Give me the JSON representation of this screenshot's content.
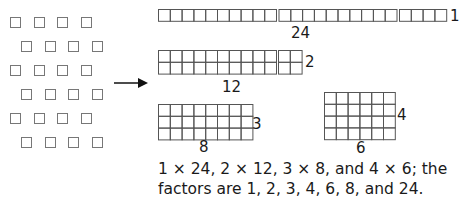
{
  "figure": {
    "ungrouped_squares": {
      "count": 24,
      "rows": 6,
      "per_row": 4
    },
    "arrangements": [
      {
        "name": "1x24",
        "rows": 1,
        "cols": 24,
        "width_label": "24",
        "height_label": "1",
        "segments": [
          10,
          10,
          4
        ]
      },
      {
        "name": "2x12",
        "rows": 2,
        "cols": 12,
        "width_label": "12",
        "height_label": "2",
        "segments": [
          10,
          2
        ]
      },
      {
        "name": "3x8",
        "rows": 3,
        "cols": 8,
        "width_label": "8",
        "height_label": "3"
      },
      {
        "name": "4x6",
        "rows": 4,
        "cols": 6,
        "width_label": "6",
        "height_label": "4"
      }
    ],
    "caption_line1": "1 × 24, 2 × 12, 3 × 8, and 4 × 6; the",
    "caption_line2": "factors are 1, 2, 3, 4, 6, 8, and 24.",
    "colors": {
      "grid_line": "#555555",
      "loose_square": "#777777",
      "text": "#1a1a1a"
    }
  }
}
